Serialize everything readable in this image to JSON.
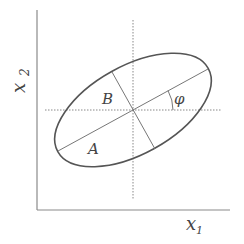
{
  "diagram": {
    "type": "error-ellipse",
    "axis_labels": {
      "x": "x",
      "x_sub": "1",
      "y": "x",
      "y_sub": "2"
    },
    "labels": {
      "semi_major": "A",
      "semi_minor": "B",
      "angle": "φ"
    },
    "colors": {
      "axis": "#8a8a8a",
      "ellipse": "#555555",
      "guide": "#888888",
      "text": "#444444"
    },
    "ellipse": {
      "cx": 133,
      "cy": 110,
      "rx": 86,
      "ry": 44,
      "rotation_deg": -29
    }
  }
}
